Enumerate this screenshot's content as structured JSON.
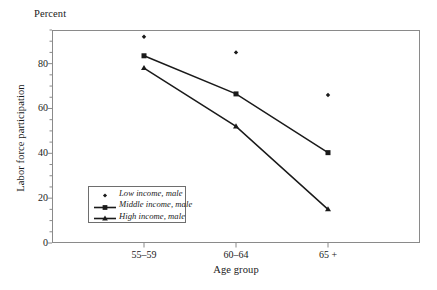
{
  "chart_data": {
    "type": "line",
    "title": "",
    "subtitle": "",
    "unit_label": "Percent",
    "xlabel": "Age group",
    "ylabel": "Labor force participation",
    "categories": [
      "55–59",
      "60–64",
      "65 +"
    ],
    "ylim": [
      0,
      95
    ],
    "yticks": [
      0,
      20,
      40,
      60,
      80
    ],
    "ytick_labels": [
      "0",
      "20",
      "40",
      "60",
      "80"
    ],
    "minor_tick_step": 5,
    "grid": false,
    "legend_position": "inside lower-left",
    "series": [
      {
        "name": "Low income, male",
        "marker": "diamond",
        "line": false,
        "values": [
          92,
          85,
          66
        ]
      },
      {
        "name": "Middle income, male",
        "marker": "square",
        "line": true,
        "values": [
          83.5,
          66.5,
          40.3
        ]
      },
      {
        "name": "High income, male",
        "marker": "triangle",
        "line": true,
        "values": [
          78,
          52,
          15
        ]
      }
    ],
    "colors": {
      "ink": "#1a1a1a",
      "frame": "#8a8a8a",
      "background": "#ffffff"
    }
  }
}
